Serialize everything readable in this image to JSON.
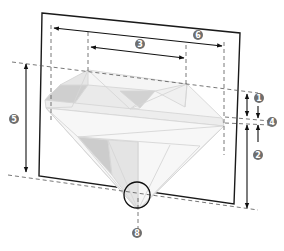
{
  "diagram": {
    "colors": {
      "frame": "#1a1a1a",
      "dash": "#555555",
      "arrow": "#111111",
      "badge": "#6e6e6e",
      "gem_stroke": "#d6d6d6",
      "gem_fill_dark": "#cfcfcf",
      "gem_fill_mid": "#e2e2e2",
      "gem_fill_light": "#efefef"
    },
    "callouts": [
      {
        "id": "1",
        "label": "1",
        "meaning": "crown-height"
      },
      {
        "id": "2",
        "label": "2",
        "meaning": "pavilion-depth"
      },
      {
        "id": "3",
        "label": "3",
        "meaning": "table-width"
      },
      {
        "id": "4",
        "label": "4",
        "meaning": "girdle"
      },
      {
        "id": "5",
        "label": "5",
        "meaning": "total-depth"
      },
      {
        "id": "6",
        "label": "6",
        "meaning": "diameter"
      },
      {
        "id": "8",
        "label": "8",
        "meaning": "culet"
      }
    ]
  }
}
